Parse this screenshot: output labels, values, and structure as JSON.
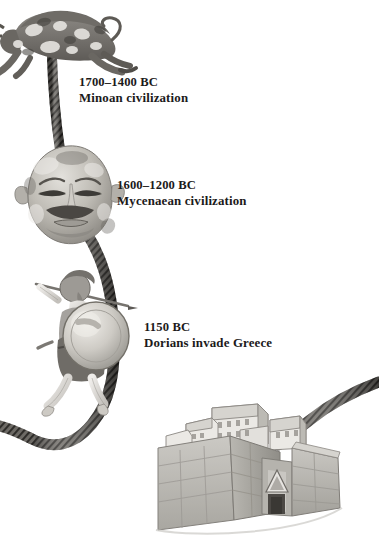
{
  "page": {
    "background_color": "#ffffff",
    "width": 379,
    "height": 542,
    "kind": "illustrated-timeline"
  },
  "timeline": {
    "connector": {
      "name": "rope-cord",
      "color": "#4a4845",
      "description": "braided rope winding from the bull down past the mask and warrior into the citadel gate"
    },
    "entries": [
      {
        "id": "minoan",
        "date": "1700–1400 BC",
        "event": "Minoan civilization",
        "icon": "leaping-bull-illustration"
      },
      {
        "id": "mycenaean",
        "date": "1600–1200 BC",
        "event": "Mycenaean civilization",
        "icon": "gold-funeral-mask-illustration"
      },
      {
        "id": "dorian",
        "date": "1150 BC",
        "event": "Dorians invade Greece",
        "icon": "dorian-warrior-illustration"
      }
    ]
  },
  "illustrations": [
    {
      "id": "bull",
      "name": "leaping-bull-illustration",
      "caption_ref": "minoan"
    },
    {
      "id": "mask",
      "name": "gold-funeral-mask-illustration",
      "caption_ref": "mycenaean"
    },
    {
      "id": "warrior",
      "name": "dorian-warrior-illustration",
      "caption_ref": "dorian"
    },
    {
      "id": "citadel",
      "name": "mycenaean-citadel-illustration",
      "caption_ref": null
    }
  ],
  "colors": {
    "text": "#1c1a1a",
    "rope_dark": "#3b3935",
    "rope_mid": "#6b6863",
    "stone_light": "#d8d6d2",
    "stone_mid": "#b4b2ad",
    "stone_dark": "#8d8b86",
    "ink": "#5a5853"
  }
}
